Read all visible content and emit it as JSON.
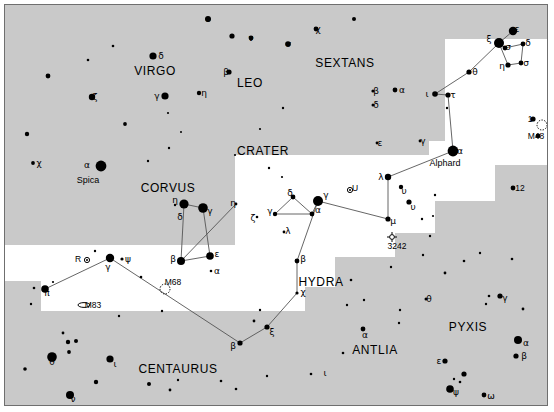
{
  "meta": {
    "background_sky": "#ffffff",
    "milky_way_band": "#c9c9c9",
    "frame_color": "#6f6f6f",
    "star_color": "#000000",
    "line_color": "#555555"
  },
  "constellation_names": [
    {
      "label": "VIRGO",
      "x": 150,
      "y": 66,
      "size": 12
    },
    {
      "label": "LEO",
      "x": 245,
      "y": 78,
      "size": 12
    },
    {
      "label": "SEXTANS",
      "x": 340,
      "y": 58,
      "size": 12
    },
    {
      "label": "CRATER",
      "x": 258,
      "y": 146,
      "size": 12
    },
    {
      "label": "CORVUS",
      "x": 163,
      "y": 183,
      "size": 12
    },
    {
      "label": "HYDRA",
      "x": 316,
      "y": 277,
      "size": 12
    },
    {
      "label": "ANTLIA",
      "x": 370,
      "y": 345,
      "size": 12
    },
    {
      "label": "PYXIS",
      "x": 463,
      "y": 322,
      "size": 12
    },
    {
      "label": "CENTAURUS",
      "x": 173,
      "y": 364,
      "size": 12
    }
  ],
  "named_stars": [
    {
      "label": "Spica",
      "x": 83,
      "y": 175
    },
    {
      "label": "Alphard",
      "x": 440,
      "y": 158
    }
  ],
  "deep_sky_objects": [
    {
      "label": "M48",
      "x": 531,
      "y": 131,
      "kind": "open-cluster",
      "mx": 537,
      "my": 120
    },
    {
      "label": "M68",
      "x": 168,
      "y": 277,
      "kind": "globular-cluster",
      "mx": 160,
      "my": 284
    },
    {
      "label": "M83",
      "x": 88,
      "y": 300,
      "kind": "galaxy",
      "mx": 79,
      "my": 300
    },
    {
      "label": "3242",
      "x": 392,
      "y": 241,
      "kind": "planetary-nebula",
      "mx": 387,
      "my": 232
    },
    {
      "label": "U",
      "x": 350,
      "y": 183,
      "kind": "variable-star",
      "mx": 345,
      "my": 185
    },
    {
      "label": "R",
      "x": 73,
      "y": 254,
      "kind": "variable-star",
      "mx": 82,
      "my": 255
    }
  ],
  "numeric_star_labels": [
    {
      "label": "1",
      "x": 525,
      "y": 114
    },
    {
      "label": "12",
      "x": 515,
      "y": 183
    }
  ],
  "greek_labels": [
    {
      "g": "ο",
      "x": 203,
      "y": 14
    },
    {
      "g": "ν",
      "x": 246,
      "y": 33
    },
    {
      "g": "σ",
      "x": 283,
      "y": 39
    },
    {
      "g": "χ",
      "x": 313,
      "y": 24
    },
    {
      "g": "δ",
      "x": 156,
      "y": 51
    },
    {
      "g": "β",
      "x": 221,
      "y": 67
    },
    {
      "g": "ζ",
      "x": 90,
      "y": 92
    },
    {
      "g": "η",
      "x": 199,
      "y": 88
    },
    {
      "g": "γ",
      "x": 152,
      "y": 91
    },
    {
      "g": "χ",
      "x": 34,
      "y": 158
    },
    {
      "g": "α",
      "x": 82,
      "y": 160
    },
    {
      "g": "β",
      "x": 371,
      "y": 86
    },
    {
      "g": "α",
      "x": 397,
      "y": 85
    },
    {
      "g": "δ",
      "x": 371,
      "y": 100
    },
    {
      "g": "ε",
      "x": 375,
      "y": 138
    },
    {
      "g": "γ",
      "x": 418,
      "y": 136
    },
    {
      "g": "ξ",
      "x": 484,
      "y": 34
    },
    {
      "g": "ε",
      "x": 512,
      "y": 24
    },
    {
      "g": "σ",
      "x": 503,
      "y": 42
    },
    {
      "g": "δ",
      "x": 523,
      "y": 38
    },
    {
      "g": "η",
      "x": 497,
      "y": 61
    },
    {
      "g": "σ",
      "x": 521,
      "y": 58
    },
    {
      "g": "θ",
      "x": 470,
      "y": 67
    },
    {
      "g": "ι",
      "x": 422,
      "y": 89
    },
    {
      "g": "τ",
      "x": 448,
      "y": 90
    },
    {
      "g": "α",
      "x": 455,
      "y": 146
    },
    {
      "g": "λ",
      "x": 376,
      "y": 172
    },
    {
      "g": "υ",
      "x": 399,
      "y": 186
    },
    {
      "g": "υ",
      "x": 408,
      "y": 202
    },
    {
      "g": "μ",
      "x": 388,
      "y": 216
    },
    {
      "g": "γ",
      "x": 321,
      "y": 190
    },
    {
      "g": "δ",
      "x": 285,
      "y": 188
    },
    {
      "g": "γ",
      "x": 265,
      "y": 206
    },
    {
      "g": "α",
      "x": 313,
      "y": 205
    },
    {
      "g": "λ",
      "x": 283,
      "y": 226
    },
    {
      "g": "ζ",
      "x": 248,
      "y": 213
    },
    {
      "g": "η",
      "x": 228,
      "y": 198
    },
    {
      "g": "β",
      "x": 298,
      "y": 254
    },
    {
      "g": "χ",
      "x": 298,
      "y": 287
    },
    {
      "g": "ξ",
      "x": 267,
      "y": 327
    },
    {
      "g": "β",
      "x": 228,
      "y": 341
    },
    {
      "g": "η",
      "x": 170,
      "y": 195
    },
    {
      "g": "δ",
      "x": 175,
      "y": 212
    },
    {
      "g": "γ",
      "x": 205,
      "y": 206
    },
    {
      "g": "β",
      "x": 168,
      "y": 254
    },
    {
      "g": "ε",
      "x": 212,
      "y": 249
    },
    {
      "g": "α",
      "x": 212,
      "y": 266
    },
    {
      "g": "ψ",
      "x": 123,
      "y": 254
    },
    {
      "g": "γ",
      "x": 103,
      "y": 262
    },
    {
      "g": "π",
      "x": 42,
      "y": 288
    },
    {
      "g": "θ",
      "x": 47,
      "y": 357
    },
    {
      "g": "ι",
      "x": 110,
      "y": 359
    },
    {
      "g": "ν",
      "x": 68,
      "y": 394
    },
    {
      "g": "ι",
      "x": 320,
      "y": 368
    },
    {
      "g": "α",
      "x": 360,
      "y": 330
    },
    {
      "g": "θ",
      "x": 424,
      "y": 294
    },
    {
      "g": "γ",
      "x": 500,
      "y": 293
    },
    {
      "g": "α",
      "x": 521,
      "y": 338
    },
    {
      "g": "β",
      "x": 519,
      "y": 351
    },
    {
      "g": "ε",
      "x": 434,
      "y": 356
    },
    {
      "g": "ψ",
      "x": 451,
      "y": 387
    },
    {
      "g": "ω",
      "x": 486,
      "y": 391
    }
  ],
  "stars": [
    {
      "x": 203,
      "y": 14,
      "r": 3.0
    },
    {
      "x": 227,
      "y": 31,
      "r": 2.6
    },
    {
      "x": 246,
      "y": 33,
      "r": 2.4
    },
    {
      "x": 283,
      "y": 39,
      "r": 2.8
    },
    {
      "x": 311,
      "y": 24,
      "r": 2.4
    },
    {
      "x": 148,
      "y": 51,
      "r": 3.6
    },
    {
      "x": 224,
      "y": 67,
      "r": 2.6
    },
    {
      "x": 87,
      "y": 92,
      "r": 3.2
    },
    {
      "x": 194,
      "y": 88,
      "r": 2.2
    },
    {
      "x": 160,
      "y": 91,
      "r": 3.6
    },
    {
      "x": 43,
      "y": 71,
      "r": 2.4
    },
    {
      "x": 108,
      "y": 41,
      "r": 1.3
    },
    {
      "x": 83,
      "y": 55,
      "r": 1.3
    },
    {
      "x": 120,
      "y": 119,
      "r": 1.9
    },
    {
      "x": 22,
      "y": 129,
      "r": 2.2
    },
    {
      "x": 28,
      "y": 158,
      "r": 1.9
    },
    {
      "x": 96,
      "y": 161,
      "r": 5.4
    },
    {
      "x": 164,
      "y": 143,
      "r": 1.2
    },
    {
      "x": 143,
      "y": 156,
      "r": 1.2
    },
    {
      "x": 163,
      "y": 108,
      "r": 1.1
    },
    {
      "x": 176,
      "y": 127,
      "r": 1.0
    },
    {
      "x": 368,
      "y": 86,
      "r": 1.6
    },
    {
      "x": 390,
      "y": 85,
      "r": 2.4
    },
    {
      "x": 368,
      "y": 100,
      "r": 1.5
    },
    {
      "x": 372,
      "y": 138,
      "r": 1.4
    },
    {
      "x": 415,
      "y": 136,
      "r": 1.4
    },
    {
      "x": 349,
      "y": 14,
      "r": 2.0
    },
    {
      "x": 494,
      "y": 38,
      "r": 5.0
    },
    {
      "x": 508,
      "y": 26,
      "r": 4.2
    },
    {
      "x": 500,
      "y": 43,
      "r": 2.4
    },
    {
      "x": 518,
      "y": 39,
      "r": 2.4
    },
    {
      "x": 503,
      "y": 60,
      "r": 2.6
    },
    {
      "x": 516,
      "y": 58,
      "r": 2.4
    },
    {
      "x": 464,
      "y": 67,
      "r": 2.6
    },
    {
      "x": 430,
      "y": 89,
      "r": 2.8
    },
    {
      "x": 443,
      "y": 90,
      "r": 2.6
    },
    {
      "x": 442,
      "y": 103,
      "r": 1.2
    },
    {
      "x": 448,
      "y": 146,
      "r": 5.4
    },
    {
      "x": 528,
      "y": 114,
      "r": 2.6
    },
    {
      "x": 533,
      "y": 131,
      "r": 2.4
    },
    {
      "x": 508,
      "y": 183,
      "r": 2.4
    },
    {
      "x": 383,
      "y": 172,
      "r": 3.2
    },
    {
      "x": 396,
      "y": 182,
      "r": 2.2
    },
    {
      "x": 404,
      "y": 197,
      "r": 2.6
    },
    {
      "x": 383,
      "y": 214,
      "r": 2.6
    },
    {
      "x": 313,
      "y": 196,
      "r": 5.0
    },
    {
      "x": 430,
      "y": 190,
      "r": 1.2
    },
    {
      "x": 417,
      "y": 214,
      "r": 1.2
    },
    {
      "x": 428,
      "y": 211,
      "r": 1.1
    },
    {
      "x": 288,
      "y": 192,
      "r": 2.4
    },
    {
      "x": 270,
      "y": 209,
      "r": 2.2
    },
    {
      "x": 307,
      "y": 209,
      "r": 2.4
    },
    {
      "x": 279,
      "y": 227,
      "r": 1.4
    },
    {
      "x": 252,
      "y": 212,
      "r": 1.3
    },
    {
      "x": 231,
      "y": 199,
      "r": 1.4
    },
    {
      "x": 292,
      "y": 256,
      "r": 2.4
    },
    {
      "x": 292,
      "y": 288,
      "r": 1.6
    },
    {
      "x": 262,
      "y": 322,
      "r": 2.6
    },
    {
      "x": 249,
      "y": 316,
      "r": 1.4
    },
    {
      "x": 235,
      "y": 338,
      "r": 2.6
    },
    {
      "x": 255,
      "y": 305,
      "r": 1.2
    },
    {
      "x": 179,
      "y": 199,
      "r": 4.6
    },
    {
      "x": 198,
      "y": 203,
      "r": 4.8
    },
    {
      "x": 170,
      "y": 200,
      "r": 1.2
    },
    {
      "x": 176,
      "y": 256,
      "r": 4.0
    },
    {
      "x": 205,
      "y": 251,
      "r": 3.8
    },
    {
      "x": 206,
      "y": 266,
      "r": 1.3
    },
    {
      "x": 117,
      "y": 254,
      "r": 1.6
    },
    {
      "x": 105,
      "y": 253,
      "r": 4.2
    },
    {
      "x": 40,
      "y": 284,
      "r": 3.8
    },
    {
      "x": 47,
      "y": 352,
      "r": 4.8
    },
    {
      "x": 105,
      "y": 354,
      "r": 3.6
    },
    {
      "x": 65,
      "y": 390,
      "r": 4.0
    },
    {
      "x": 58,
      "y": 328,
      "r": 1.4
    },
    {
      "x": 63,
      "y": 337,
      "r": 2.2
    },
    {
      "x": 71,
      "y": 336,
      "r": 2.0
    },
    {
      "x": 64,
      "y": 347,
      "r": 1.9
    },
    {
      "x": 20,
      "y": 364,
      "r": 1.8
    },
    {
      "x": 91,
      "y": 377,
      "r": 2.2
    },
    {
      "x": 144,
      "y": 379,
      "r": 2.0
    },
    {
      "x": 165,
      "y": 385,
      "r": 1.4
    },
    {
      "x": 173,
      "y": 375,
      "r": 1.2
    },
    {
      "x": 26,
      "y": 299,
      "r": 1.2
    },
    {
      "x": 48,
      "y": 277,
      "r": 1.1
    },
    {
      "x": 29,
      "y": 283,
      "r": 1.3
    },
    {
      "x": 358,
      "y": 324,
      "r": 2.4
    },
    {
      "x": 421,
      "y": 294,
      "r": 1.5
    },
    {
      "x": 495,
      "y": 291,
      "r": 2.6
    },
    {
      "x": 484,
      "y": 291,
      "r": 1.3
    },
    {
      "x": 513,
      "y": 335,
      "r": 4.0
    },
    {
      "x": 511,
      "y": 351,
      "r": 2.6
    },
    {
      "x": 440,
      "y": 356,
      "r": 2.6
    },
    {
      "x": 445,
      "y": 384,
      "r": 3.8
    },
    {
      "x": 479,
      "y": 390,
      "r": 2.4
    },
    {
      "x": 459,
      "y": 369,
      "r": 2.6
    },
    {
      "x": 455,
      "y": 377,
      "r": 1.3
    },
    {
      "x": 449,
      "y": 374,
      "r": 1.2
    },
    {
      "x": 440,
      "y": 268,
      "r": 1.4
    },
    {
      "x": 459,
      "y": 256,
      "r": 1.3
    },
    {
      "x": 475,
      "y": 248,
      "r": 1.2
    },
    {
      "x": 507,
      "y": 254,
      "r": 1.3
    },
    {
      "x": 518,
      "y": 304,
      "r": 1.4
    },
    {
      "x": 481,
      "y": 299,
      "r": 1.2
    },
    {
      "x": 386,
      "y": 262,
      "r": 1.2
    },
    {
      "x": 346,
      "y": 275,
      "r": 1.3
    },
    {
      "x": 359,
      "y": 295,
      "r": 1.2
    },
    {
      "x": 342,
      "y": 300,
      "r": 1.2
    },
    {
      "x": 306,
      "y": 369,
      "r": 1.3
    },
    {
      "x": 338,
      "y": 348,
      "r": 1.3
    },
    {
      "x": 395,
      "y": 305,
      "r": 1.2
    },
    {
      "x": 418,
      "y": 250,
      "r": 1.2
    },
    {
      "x": 425,
      "y": 231,
      "r": 1.2
    },
    {
      "x": 394,
      "y": 318,
      "r": 1.2
    },
    {
      "x": 262,
      "y": 371,
      "r": 1.2
    },
    {
      "x": 216,
      "y": 376,
      "r": 1.3
    },
    {
      "x": 231,
      "y": 384,
      "r": 1.3
    },
    {
      "x": 114,
      "y": 311,
      "r": 1.2
    },
    {
      "x": 157,
      "y": 306,
      "r": 1.2
    },
    {
      "x": 90,
      "y": 246,
      "r": 1.2
    },
    {
      "x": 136,
      "y": 272,
      "r": 1.3
    },
    {
      "x": 278,
      "y": 103,
      "r": 1.2
    },
    {
      "x": 255,
      "y": 124,
      "r": 1.1
    },
    {
      "x": 264,
      "y": 163,
      "r": 1.2
    },
    {
      "x": 277,
      "y": 172,
      "r": 1.1
    },
    {
      "x": 230,
      "y": 150,
      "r": 1.1
    }
  ],
  "constellation_lines": [
    {
      "name": "hydra-head-zeta-epsilon",
      "pts": [
        [
          494,
          38
        ],
        [
          508,
          26
        ]
      ]
    },
    {
      "name": "hydra-head-zeta-sigma",
      "pts": [
        [
          494,
          38
        ],
        [
          500,
          43
        ]
      ]
    },
    {
      "name": "hydra-head-sigma-delta",
      "pts": [
        [
          500,
          43
        ],
        [
          518,
          39
        ]
      ]
    },
    {
      "name": "hydra-head-delta-sigma2",
      "pts": [
        [
          518,
          39
        ],
        [
          516,
          58
        ]
      ]
    },
    {
      "name": "hydra-head-sigma2-eta",
      "pts": [
        [
          516,
          58
        ],
        [
          503,
          60
        ]
      ]
    },
    {
      "name": "hydra-head-eta-zeta",
      "pts": [
        [
          503,
          60
        ],
        [
          494,
          38
        ]
      ]
    },
    {
      "name": "hydra-zeta-theta",
      "pts": [
        [
          494,
          38
        ],
        [
          464,
          67
        ]
      ]
    },
    {
      "name": "hydra-theta-iota",
      "pts": [
        [
          464,
          67
        ],
        [
          430,
          89
        ]
      ]
    },
    {
      "name": "hydra-iota-tau",
      "pts": [
        [
          430,
          89
        ],
        [
          443,
          90
        ]
      ]
    },
    {
      "name": "hydra-tau-alphard",
      "pts": [
        [
          443,
          90
        ],
        [
          448,
          146
        ]
      ]
    },
    {
      "name": "hydra-alphard-lambda",
      "pts": [
        [
          448,
          146
        ],
        [
          383,
          172
        ]
      ]
    },
    {
      "name": "hydra-lambda-mu",
      "pts": [
        [
          383,
          172
        ],
        [
          383,
          214
        ]
      ]
    },
    {
      "name": "hydra-mu-gamma-crater",
      "pts": [
        [
          383,
          214
        ],
        [
          313,
          196
        ]
      ]
    },
    {
      "name": "hydra-gamma-down",
      "pts": [
        [
          313,
          196
        ],
        [
          292,
          256
        ]
      ]
    },
    {
      "name": "hydra-beta-chi",
      "pts": [
        [
          292,
          256
        ],
        [
          292,
          288
        ]
      ]
    },
    {
      "name": "hydra-chi-xi",
      "pts": [
        [
          292,
          288
        ],
        [
          262,
          322
        ]
      ]
    },
    {
      "name": "hydra-xi-beta",
      "pts": [
        [
          262,
          322
        ],
        [
          235,
          338
        ]
      ]
    },
    {
      "name": "hydra-beta-gamma-corvus",
      "pts": [
        [
          235,
          338
        ],
        [
          105,
          253
        ]
      ]
    },
    {
      "name": "hydra-eta-zeta-tail",
      "pts": [
        [
          231,
          199
        ],
        [
          176,
          256
        ]
      ]
    },
    {
      "name": "corvus-delta-gamma",
      "pts": [
        [
          179,
          199
        ],
        [
          198,
          203
        ]
      ]
    },
    {
      "name": "corvus-gamma-epsilon",
      "pts": [
        [
          198,
          203
        ],
        [
          205,
          251
        ]
      ]
    },
    {
      "name": "corvus-epsilon-beta",
      "pts": [
        [
          205,
          251
        ],
        [
          176,
          256
        ]
      ]
    },
    {
      "name": "corvus-beta-delta",
      "pts": [
        [
          176,
          256
        ],
        [
          179,
          199
        ]
      ]
    },
    {
      "name": "crater-delta-gamma",
      "pts": [
        [
          288,
          192
        ],
        [
          270,
          209
        ]
      ]
    },
    {
      "name": "crater-gamma-alpha",
      "pts": [
        [
          270,
          209
        ],
        [
          307,
          209
        ]
      ]
    },
    {
      "name": "crater-alpha-delta",
      "pts": [
        [
          307,
          209
        ],
        [
          288,
          192
        ]
      ]
    },
    {
      "name": "crater-alpha-gamma-hydra",
      "pts": [
        [
          307,
          209
        ],
        [
          313,
          196
        ]
      ]
    },
    {
      "name": "cen-gamma-pi",
      "pts": [
        [
          105,
          253
        ],
        [
          40,
          284
        ]
      ]
    }
  ],
  "milky_way_regions": [
    {
      "x": 0,
      "y": 0,
      "w": 542,
      "h": 34
    },
    {
      "x": 0,
      "y": 0,
      "w": 424,
      "h": 150
    },
    {
      "x": 0,
      "y": 0,
      "w": 230,
      "h": 240
    },
    {
      "x": 330,
      "y": 0,
      "w": 110,
      "h": 136
    },
    {
      "x": 490,
      "y": 160,
      "w": 52,
      "h": 240
    },
    {
      "x": 430,
      "y": 196,
      "w": 112,
      "h": 204
    },
    {
      "x": 390,
      "y": 228,
      "w": 152,
      "h": 172
    },
    {
      "x": 330,
      "y": 252,
      "w": 212,
      "h": 148
    },
    {
      "x": 300,
      "y": 282,
      "w": 242,
      "h": 118
    },
    {
      "x": 180,
      "y": 306,
      "w": 362,
      "h": 94
    },
    {
      "x": 0,
      "y": 306,
      "w": 180,
      "h": 94
    },
    {
      "x": 0,
      "y": 276,
      "w": 36,
      "h": 124
    }
  ]
}
